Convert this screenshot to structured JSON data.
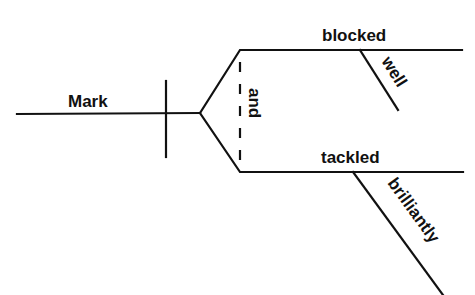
{
  "diagram": {
    "type": "sentence-diagram",
    "subject": "Mark",
    "conjunction": "and",
    "predicates": [
      {
        "verb": "blocked",
        "modifier": "well"
      },
      {
        "verb": "tackled",
        "modifier": "brilliantly"
      }
    ],
    "line_color": "#111111",
    "background": "#ffffff"
  }
}
